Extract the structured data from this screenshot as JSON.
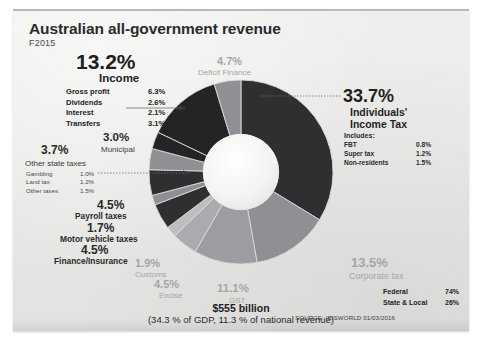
{
  "header": {
    "title": "Australian all-government revenue",
    "subtitle": "F2015"
  },
  "income": {
    "pct": "13.2%",
    "label": "Income",
    "rows": [
      {
        "label": "Gross profit",
        "value": "6.3%"
      },
      {
        "label": "Dividends",
        "value": "2.6%"
      },
      {
        "label": "Interest",
        "value": "2.1%"
      },
      {
        "label": "Transfers",
        "value": "3.1%"
      }
    ]
  },
  "municipal": {
    "pct": "3.0%",
    "label": "Municipal"
  },
  "other_state_taxes": {
    "pct": "3.7%",
    "label": "Other state taxes",
    "rows": [
      {
        "label": "Gambling",
        "value": "1.0%"
      },
      {
        "label": "Land tax",
        "value": "1.2%"
      },
      {
        "label": "Other taxes",
        "value": "1.5%"
      }
    ]
  },
  "payroll": {
    "pct": "4.5%",
    "label": "Payroll taxes"
  },
  "motor_vehicle": {
    "pct": "1.7%",
    "label": "Motor vehicle taxes"
  },
  "finance_insurance": {
    "pct": "4.5%",
    "label": "Finance/Insurance"
  },
  "deficit": {
    "pct": "4.7%",
    "label": "Deficit Finance"
  },
  "customs": {
    "pct": "1.9%",
    "label": "Customs"
  },
  "excise": {
    "pct": "4.5%",
    "label": "Excise"
  },
  "gst": {
    "pct": "11.1%",
    "label": "GST"
  },
  "corporate": {
    "pct": "13.5%",
    "label": "Corporate tax"
  },
  "individuals": {
    "pct": "33.7%",
    "label_line1": "Individuals'",
    "label_line2": "Income Tax",
    "includes_label": "Includes:",
    "rows": [
      {
        "label": "FBT",
        "value": "0.8%"
      },
      {
        "label": "Super tax",
        "value": "1.2%"
      },
      {
        "label": "Non-residents",
        "value": "1.5%"
      }
    ]
  },
  "totals": {
    "amount": "$555 billion",
    "detail": "(34.3 % of GDP, 11.3 % of national revenue)"
  },
  "split": [
    {
      "label": "Federal",
      "value": "74%"
    },
    {
      "label": "State & Local",
      "value": "26%"
    }
  ],
  "source": "SOURCE: IBISWORLD 01/03/2016",
  "colors": {
    "paper": "#e9e9e7",
    "dark": "#2e2f31",
    "darker": "#232426",
    "mid_gray": "#8e9093",
    "light_gray": "#a9abae",
    "pale_gray": "#bcbec0",
    "leader": "#6f6f6f"
  },
  "chart_data": {
    "type": "pie",
    "title": "Australian all-government revenue F2015",
    "subtitle": "$555 billion (34.3 % of GDP, 11.3 % of national revenue)",
    "hole": 0.41,
    "start_angle_deg": -90,
    "direction": "clockwise",
    "legend": "labels around chart",
    "categories": [
      "Individuals' Income Tax",
      "Corporate tax",
      "GST",
      "Excise",
      "Customs",
      "Finance/Insurance",
      "Motor vehicle taxes",
      "Payroll taxes",
      "Other state taxes",
      "Municipal",
      "Income",
      "Deficit Finance"
    ],
    "values": [
      33.7,
      13.5,
      11.1,
      4.5,
      1.9,
      4.5,
      1.7,
      4.5,
      3.7,
      3.0,
      13.2,
      4.7
    ],
    "slice_colors": [
      "#2e2f31",
      "#8e9093",
      "#9b9da0",
      "#a9abae",
      "#bcbec0",
      "#2e2f31",
      "#8e9093",
      "#2e2f31",
      "#8e9093",
      "#232426",
      "#232426",
      "#8e9093"
    ],
    "ylabel": "",
    "xlabel": ""
  }
}
